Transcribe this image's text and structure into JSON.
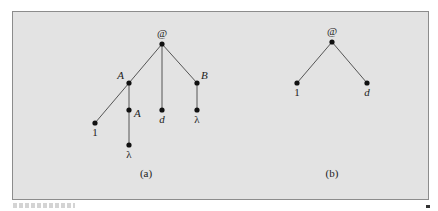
{
  "figure": {
    "colors": {
      "background": "#e3e3e3",
      "border": "#8c8c8c",
      "edge": "#555555",
      "node": "#111111",
      "text": "#222222"
    },
    "trees": [
      {
        "id": "a",
        "caption": "(a)",
        "caption_pos": [
          146,
          177
        ],
        "nodes": [
          {
            "id": "root",
            "label": "@",
            "x": 162,
            "y": 44,
            "lx": 162,
            "ly": 37,
            "anchor": "middle",
            "italic": false
          },
          {
            "id": "A1",
            "label": "A",
            "x": 129,
            "y": 83,
            "lx": 124,
            "ly": 79,
            "anchor": "end",
            "italic": true
          },
          {
            "id": "d",
            "label": "d",
            "x": 162,
            "y": 110,
            "lx": 162,
            "ly": 123,
            "anchor": "middle",
            "italic": true
          },
          {
            "id": "B",
            "label": "B",
            "x": 197,
            "y": 83,
            "lx": 201,
            "ly": 79,
            "anchor": "start",
            "italic": true
          },
          {
            "id": "one",
            "label": "1",
            "x": 95,
            "y": 123,
            "lx": 95,
            "ly": 136,
            "anchor": "middle",
            "italic": false
          },
          {
            "id": "A2",
            "label": "A",
            "x": 129,
            "y": 110,
            "lx": 134,
            "ly": 117,
            "anchor": "start",
            "italic": true
          },
          {
            "id": "lam1",
            "label": "λ",
            "x": 129,
            "y": 145,
            "lx": 129,
            "ly": 158,
            "anchor": "middle",
            "italic": false
          },
          {
            "id": "lam2",
            "label": "λ",
            "x": 197,
            "y": 110,
            "lx": 197,
            "ly": 123,
            "anchor": "middle",
            "italic": false
          }
        ],
        "edges": [
          [
            "root",
            "A1"
          ],
          [
            "root",
            "d"
          ],
          [
            "root",
            "B"
          ],
          [
            "A1",
            "one"
          ],
          [
            "A1",
            "A2"
          ],
          [
            "A2",
            "lam1"
          ],
          [
            "B",
            "lam2"
          ]
        ]
      },
      {
        "id": "b",
        "caption": "(b)",
        "caption_pos": [
          332,
          177
        ],
        "nodes": [
          {
            "id": "root",
            "label": "@",
            "x": 332,
            "y": 42,
            "lx": 332,
            "ly": 35,
            "anchor": "middle",
            "italic": false
          },
          {
            "id": "one",
            "label": "1",
            "x": 297,
            "y": 83,
            "lx": 297,
            "ly": 96,
            "anchor": "middle",
            "italic": false
          },
          {
            "id": "d",
            "label": "d",
            "x": 367,
            "y": 83,
            "lx": 367,
            "ly": 96,
            "anchor": "middle",
            "italic": true
          }
        ],
        "edges": [
          [
            "root",
            "one"
          ],
          [
            "root",
            "d"
          ]
        ]
      }
    ]
  }
}
